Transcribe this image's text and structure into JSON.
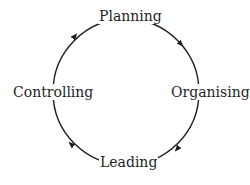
{
  "diagram": {
    "type": "cycle",
    "direction": "clockwise",
    "stroke_color": "#1e1e1e",
    "nodes": [
      {
        "id": "planning",
        "label": "Planning",
        "position": "top"
      },
      {
        "id": "organising",
        "label": "Organising",
        "position": "right"
      },
      {
        "id": "leading",
        "label": "Leading",
        "position": "bottom"
      },
      {
        "id": "controlling",
        "label": "Controlling",
        "position": "left"
      }
    ],
    "edges": [
      {
        "from": "planning",
        "to": "organising"
      },
      {
        "from": "organising",
        "to": "leading"
      },
      {
        "from": "leading",
        "to": "controlling"
      },
      {
        "from": "controlling",
        "to": "planning"
      }
    ]
  }
}
